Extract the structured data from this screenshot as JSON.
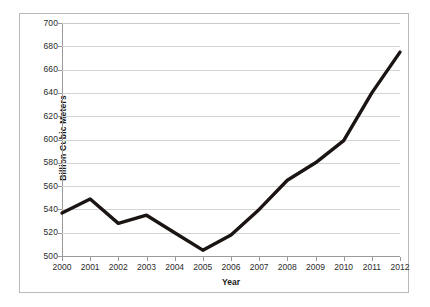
{
  "chart_data": {
    "type": "line",
    "title": "",
    "xlabel": "Year",
    "ylabel": "Billion Cubic Meters",
    "categories": [
      "2000",
      "2001",
      "2002",
      "2003",
      "2004",
      "2005",
      "2006",
      "2007",
      "2008",
      "2009",
      "2010",
      "2011",
      "2012"
    ],
    "x": [
      2000,
      2001,
      2002,
      2003,
      2004,
      2005,
      2006,
      2007,
      2008,
      2009,
      2010,
      2011,
      2012
    ],
    "values": [
      537,
      549,
      528,
      535,
      520,
      505,
      518,
      540,
      565,
      580,
      599,
      640,
      675
    ],
    "series": [
      {
        "name": "",
        "values": [
          537,
          549,
          528,
          535,
          520,
          505,
          518,
          540,
          565,
          580,
          599,
          640,
          675
        ]
      }
    ],
    "ylim": [
      500,
      700
    ],
    "xlim": [
      2000,
      2012
    ],
    "y_ticks": [
      500,
      520,
      540,
      560,
      580,
      600,
      620,
      640,
      660,
      680,
      700
    ],
    "y_tick_labels": [
      "500",
      "520",
      "540",
      "560",
      "580",
      "600",
      "620",
      "640",
      "660",
      "680",
      "700"
    ],
    "x_tick_labels": [
      "2000",
      "2001",
      "2002",
      "2003",
      "2004",
      "2005",
      "2006",
      "2007",
      "2008",
      "2009",
      "2010",
      "2011",
      "2012"
    ],
    "grid": "horizontal",
    "legend": "none",
    "line_color": "#1a1412",
    "line_width": 3.4,
    "grid_color": "#d4d4d4",
    "axis_color": "#9a9a9a",
    "background": "#ffffff",
    "annotations": []
  },
  "figure": {
    "border_color": "#b9b9b9"
  }
}
